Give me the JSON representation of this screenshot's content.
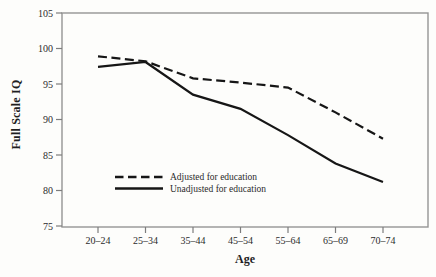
{
  "chart_data": {
    "type": "line",
    "title": "",
    "xlabel": "Age",
    "ylabel": "Full Scale IQ",
    "categories": [
      "20–24",
      "25–34",
      "35–44",
      "45–54",
      "55–64",
      "65–69",
      "70–74"
    ],
    "series": [
      {
        "name": "Adjusted for education",
        "line_style": "dashed",
        "values": [
          98.9,
          98.2,
          95.8,
          95.2,
          94.5,
          91.0,
          87.3
        ]
      },
      {
        "name": "Unadjusted for education",
        "line_style": "solid",
        "values": [
          97.4,
          98.1,
          93.5,
          91.5,
          87.8,
          83.8,
          81.2
        ]
      }
    ],
    "ylim": [
      75,
      105
    ],
    "yticks": [
      105,
      100,
      95,
      90,
      85,
      80,
      75
    ],
    "grid": false,
    "legend_position": "inside-bottom-left",
    "colors": {
      "line": "#161616",
      "frame": "#949494",
      "text": "#2b2b2b",
      "background": "#fdfdfb"
    }
  }
}
